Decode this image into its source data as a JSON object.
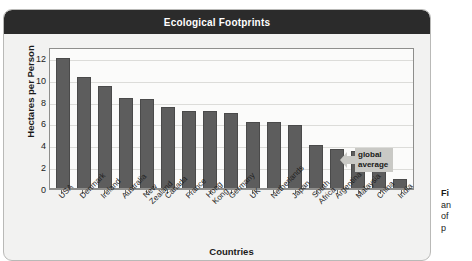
{
  "chart_data": {
    "type": "bar",
    "title": "Ecological Footprints",
    "xlabel": "Countries",
    "ylabel": "Hectares per Person",
    "ylim": [
      0,
      13
    ],
    "yticks": [
      0,
      2,
      4,
      6,
      8,
      10,
      12
    ],
    "grid": true,
    "legend": "none",
    "categories": [
      "USA",
      "Denmark",
      "Ireland",
      "Australia",
      "New Zealand",
      "Canada",
      "France",
      "Hong Kong",
      "Germany",
      "UK",
      "Netherlands",
      "Japan",
      "South Africa",
      "Argentina",
      "Malaysia",
      "China",
      "India"
    ],
    "values": [
      12.0,
      10.3,
      9.4,
      8.3,
      8.2,
      7.5,
      7.1,
      7.1,
      7.0,
      6.1,
      6.1,
      5.9,
      4.0,
      3.7,
      3.5,
      1.8,
      0.9
    ],
    "annotations": [
      {
        "label_line1": "global",
        "label_line2": "average",
        "value": 2.7,
        "kind": "arrow-callout"
      }
    ],
    "colors": {
      "bar": "#5d5d5d",
      "bar_border": "#4a4a4a",
      "title_bar": "#2b2b2b",
      "title_text": "#ffffff",
      "panel": "#f2f2f1",
      "plot_background": "#fbfbfa",
      "gridline": "#dcdcd9",
      "callout": "#c9c9c5"
    }
  },
  "figure": {
    "title": "Ecological Footprints",
    "axis_x_title": "Countries",
    "axis_y_title": "Hectares per Person"
  },
  "callout": {
    "line1": "global",
    "line2": "average"
  },
  "caption": {
    "title": "Fi",
    "line1": "an",
    "line2": "of",
    "line3": "p"
  }
}
